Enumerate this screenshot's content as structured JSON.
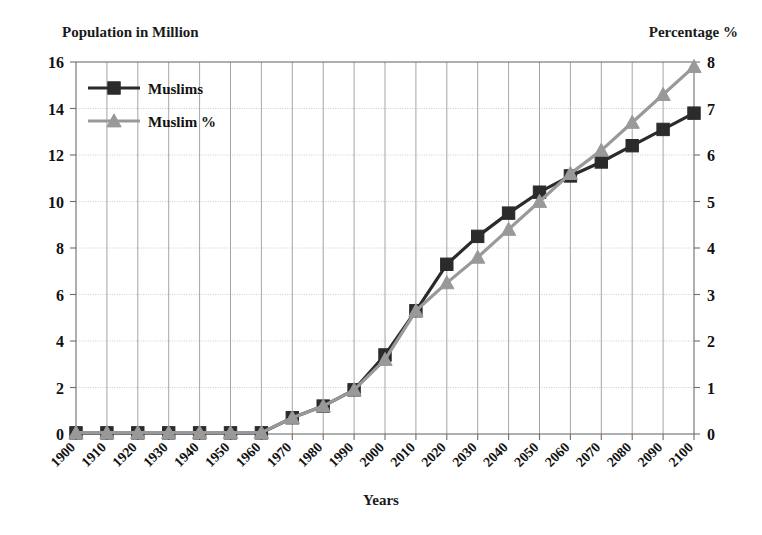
{
  "chart_data": {
    "type": "line",
    "title": "",
    "xlabel": "Years",
    "ylabel": "Population in Million",
    "y2label": "Percentage %",
    "grid": true,
    "legend_position": "top-left",
    "categories": [
      "1900",
      "1910",
      "1920",
      "1930",
      "1940",
      "1950",
      "1960",
      "1970",
      "1980",
      "1990",
      "2000",
      "2010",
      "2020",
      "2030",
      "2040",
      "2050",
      "2060",
      "2070",
      "2080",
      "2090",
      "2100"
    ],
    "ylim": [
      0,
      16
    ],
    "yticks": [
      "0",
      "2",
      "4",
      "6",
      "8",
      "10",
      "12",
      "14",
      "16"
    ],
    "y2lim": [
      0,
      8
    ],
    "y2ticks": [
      "0",
      "1",
      "2",
      "3",
      "4",
      "5",
      "6",
      "7",
      "8"
    ],
    "series": [
      {
        "name": "Muslims",
        "axis": "left",
        "color": "#2b2b2b",
        "marker": "square",
        "unit": "million",
        "values": [
          0.05,
          0.05,
          0.05,
          0.05,
          0.05,
          0.05,
          0.05,
          0.7,
          1.2,
          1.9,
          3.4,
          5.3,
          7.3,
          8.5,
          9.5,
          10.4,
          11.1,
          11.7,
          12.4,
          13.1,
          13.8
        ]
      },
      {
        "name": "Muslim %",
        "axis": "right",
        "color": "#999999",
        "marker": "triangle",
        "unit": "percent",
        "values": [
          0.03,
          0.03,
          0.03,
          0.03,
          0.03,
          0.03,
          0.03,
          0.35,
          0.6,
          0.95,
          1.6,
          2.65,
          3.25,
          3.8,
          4.4,
          5.0,
          5.6,
          6.1,
          6.7,
          7.3,
          7.9
        ]
      }
    ]
  },
  "legend": {
    "items": [
      {
        "label": "Muslims",
        "color": "#2b2b2b",
        "marker": "square"
      },
      {
        "label": "Muslim %",
        "color": "#999999",
        "marker": "triangle"
      }
    ]
  },
  "axes": {
    "left_title": "Population in Million",
    "right_title": "Percentage %",
    "x_title": "Years"
  }
}
